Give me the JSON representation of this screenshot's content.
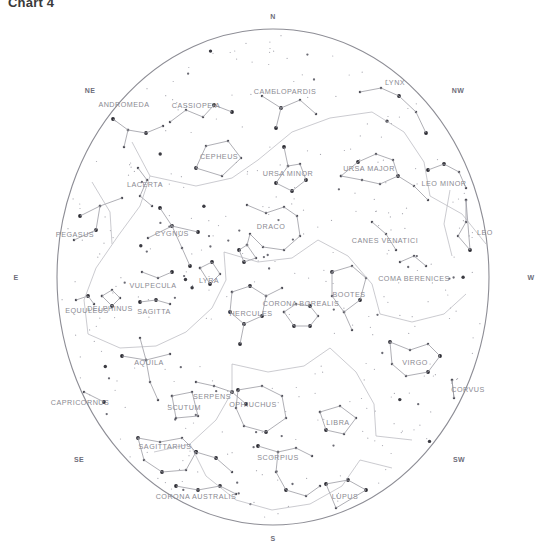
{
  "title": "Chart 4",
  "chart_data": {
    "type": "scatter",
    "title": "Chart 4",
    "subtitle": "",
    "xlabel": "",
    "ylabel": "",
    "projection": "stereographic-horizon-dome",
    "grid": false,
    "legend_position": "none",
    "horizon_circle": {
      "cx": 273,
      "cy": 277,
      "rx": 216,
      "ry": 248,
      "stroke": "#8d8d95"
    },
    "axis_note": "Celestial sphere dome; compass points mark the horizon azimuths.",
    "cardinals": [
      {
        "label": "N",
        "x": 273,
        "y": 16,
        "azimuth": 0
      },
      {
        "label": "NE",
        "x": 90,
        "y": 90,
        "azimuth": 45
      },
      {
        "label": "NW",
        "x": 458,
        "y": 90,
        "azimuth": 315
      },
      {
        "label": "E",
        "x": 16,
        "y": 277,
        "azimuth": 90
      },
      {
        "label": "W",
        "x": 531,
        "y": 277,
        "azimuth": 270
      },
      {
        "label": "SE",
        "x": 79,
        "y": 459,
        "azimuth": 135
      },
      {
        "label": "SW",
        "x": 459,
        "y": 459,
        "azimuth": 225
      },
      {
        "label": "S",
        "x": 273,
        "y": 538,
        "azimuth": 180
      }
    ],
    "constellations": [
      {
        "name": "ANDROMEDA",
        "x": 124,
        "y": 104
      },
      {
        "name": "CASSIOPEIA",
        "x": 196,
        "y": 105
      },
      {
        "name": "CAMELOPARDIS",
        "x": 285,
        "y": 91
      },
      {
        "name": "LYNX",
        "x": 395,
        "y": 82
      },
      {
        "name": "CEPHEUS",
        "x": 219,
        "y": 156
      },
      {
        "name": "URSA MINOR",
        "x": 288,
        "y": 173
      },
      {
        "name": "URSA MAJOR",
        "x": 369,
        "y": 168
      },
      {
        "name": "LEO MINOR",
        "x": 444,
        "y": 183
      },
      {
        "name": "LACERTA",
        "x": 145,
        "y": 184
      },
      {
        "name": "DRACO",
        "x": 271,
        "y": 226
      },
      {
        "name": "PEGASUS",
        "x": 75,
        "y": 234
      },
      {
        "name": "CYGNUS",
        "x": 172,
        "y": 233
      },
      {
        "name": "CANES VENATICI",
        "x": 385,
        "y": 240
      },
      {
        "name": "LEO",
        "x": 485,
        "y": 232
      },
      {
        "name": "COMA BERENICES",
        "x": 414,
        "y": 278
      },
      {
        "name": "VULPECULA",
        "x": 153,
        "y": 285
      },
      {
        "name": "LYRA",
        "x": 209,
        "y": 280
      },
      {
        "name": "BOOTES",
        "x": 349,
        "y": 294
      },
      {
        "name": "CORONA BOREALIS",
        "x": 301,
        "y": 303
      },
      {
        "name": "DELPHINUS",
        "x": 110,
        "y": 308
      },
      {
        "name": "EQUULEUS",
        "x": 87,
        "y": 310
      },
      {
        "name": "SAGITTA",
        "x": 154,
        "y": 311
      },
      {
        "name": "HERCULES",
        "x": 251,
        "y": 313
      },
      {
        "name": "AQUILA",
        "x": 149,
        "y": 362
      },
      {
        "name": "VIRGO",
        "x": 415,
        "y": 362
      },
      {
        "name": "CORVUS",
        "x": 468,
        "y": 389
      },
      {
        "name": "CAPRICORNUS",
        "x": 80,
        "y": 402
      },
      {
        "name": "SERPENS",
        "x": 212,
        "y": 396
      },
      {
        "name": "SCUTUM",
        "x": 184,
        "y": 407
      },
      {
        "name": "OPHIUCHUS",
        "x": 253,
        "y": 404
      },
      {
        "name": "LIBRA",
        "x": 338,
        "y": 422
      },
      {
        "name": "SAGITTARIUS",
        "x": 165,
        "y": 446
      },
      {
        "name": "SCORPIUS",
        "x": 278,
        "y": 457
      },
      {
        "name": "CORONA AUSTRALIS",
        "x": 196,
        "y": 496
      },
      {
        "name": "LUPUS",
        "x": 345,
        "y": 496
      }
    ],
    "stars_count": 340
  }
}
